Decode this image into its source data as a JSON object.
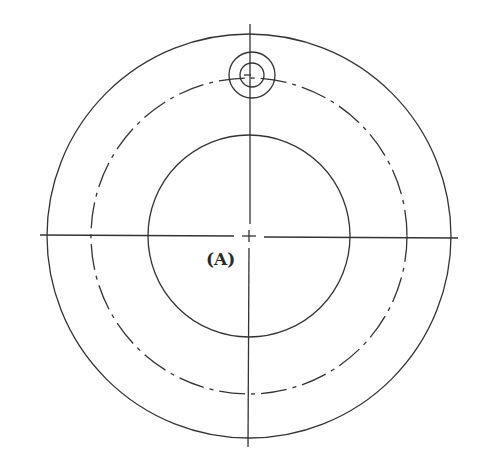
{
  "diagram": {
    "type": "technical-drawing",
    "label": "(A)",
    "stroke_color": "#333333",
    "center": {
      "x": 249,
      "y": 236
    },
    "outer_circle": {
      "r": 202,
      "style": "solid"
    },
    "pitch_circle": {
      "r": 158,
      "style": "dash-dot"
    },
    "inner_circle": {
      "r": 101,
      "style": "solid"
    },
    "hole": {
      "cx": 252,
      "cy": 75,
      "outer_r": 23,
      "inner_r": 12
    },
    "centerlines": {
      "horizontal": {
        "x1": 40,
        "x2": 458,
        "y": 236
      },
      "vertical": {
        "x": 248,
        "y1": 24,
        "y2": 447
      }
    }
  }
}
